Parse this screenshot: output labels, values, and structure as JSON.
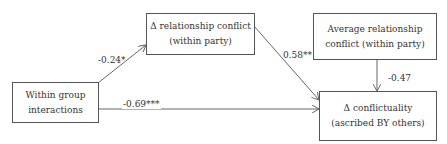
{
  "nodes": {
    "mediator": {
      "line1": "Δ relationship conflict",
      "line2": "(within party)"
    },
    "moderator": {
      "line1": "Average relationship",
      "line2": "conflict (within party)"
    },
    "predictor": {
      "line1": "Within group",
      "line2": "interactions"
    },
    "outcome": {
      "line1": "Δ conflictuality",
      "line2": "(ascribed BY others)"
    }
  },
  "edges": {
    "predictor_to_mediator": {
      "coef": "-0.24*"
    },
    "mediator_to_outcome": {
      "coef": "0.58**"
    },
    "moderator_to_outcome": {
      "coef": "-0.47"
    },
    "predictor_to_outcome": {
      "coef": "-0.69***"
    }
  },
  "colors": {
    "line": "#666666",
    "border": "#555555",
    "text": "#333333"
  }
}
